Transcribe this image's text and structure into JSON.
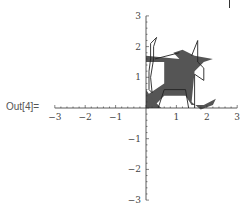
{
  "output_label": "Out[4]=",
  "chart_data": {
    "type": "polygon-graphics",
    "title": "",
    "xlabel": "",
    "ylabel": "",
    "xlim": [
      -3,
      3
    ],
    "ylim": [
      -3,
      3
    ],
    "grid": false,
    "axes_origin": [
      0,
      0
    ],
    "x_ticks": [
      -3,
      -2,
      -1,
      1,
      2,
      3
    ],
    "y_ticks": [
      -3,
      -2,
      -1,
      1,
      2,
      3
    ],
    "x_tick_labels": [
      "−3",
      "−2",
      "−1",
      "1",
      "2",
      "3"
    ],
    "y_tick_labels": [
      "−3",
      "−2",
      "−1",
      "1",
      "2",
      "3"
    ],
    "fill_color": "#555555",
    "line_color": "#222222",
    "filled_polygons": [
      {
        "name": "body",
        "points": [
          [
            0.0,
            1.5
          ],
          [
            0.6,
            1.5
          ],
          [
            0.6,
            0.8
          ],
          [
            0.0,
            0.4
          ],
          [
            0.0,
            0.0
          ],
          [
            0.3,
            0.1
          ],
          [
            0.6,
            0.4
          ],
          [
            1.3,
            0.4
          ],
          [
            1.5,
            0.1
          ],
          [
            1.9,
            0.1
          ],
          [
            2.3,
            0.3
          ],
          [
            2.2,
            0.1
          ],
          [
            1.8,
            -0.05
          ],
          [
            1.5,
            0.2
          ],
          [
            1.6,
            1.2
          ],
          [
            1.9,
            1.5
          ],
          [
            2.2,
            1.6
          ],
          [
            1.6,
            1.7
          ],
          [
            1.2,
            1.9
          ],
          [
            0.9,
            1.8
          ],
          [
            1.1,
            1.6
          ],
          [
            0.0,
            1.7
          ]
        ]
      },
      {
        "name": "left-leg",
        "points": [
          [
            0.0,
            0.0
          ],
          [
            0.0,
            0.6
          ],
          [
            0.2,
            0.3
          ],
          [
            0.5,
            0.0
          ]
        ]
      }
    ],
    "outline_polygons": [
      {
        "name": "left-curve",
        "points": [
          [
            0.15,
            1.6
          ],
          [
            0.15,
            2.1
          ],
          [
            0.35,
            2.3
          ],
          [
            0.25,
            2.0
          ],
          [
            0.25,
            1.6
          ],
          [
            0.15,
            1.0
          ],
          [
            0.2,
            0.5
          ],
          [
            0.1,
            0.6
          ],
          [
            0.1,
            1.2
          ],
          [
            0.15,
            1.6
          ]
        ]
      },
      {
        "name": "leg-box",
        "points": [
          [
            0.4,
            0.0
          ],
          [
            0.6,
            0.6
          ],
          [
            1.3,
            0.6
          ],
          [
            1.4,
            0.0
          ]
        ]
      },
      {
        "name": "top-line",
        "points": [
          [
            0.3,
            1.6
          ],
          [
            1.1,
            1.8
          ]
        ]
      },
      {
        "name": "horn",
        "points": [
          [
            1.5,
            1.7
          ],
          [
            1.7,
            2.2
          ],
          [
            1.7,
            1.5
          ]
        ]
      },
      {
        "name": "right-zigzag",
        "points": [
          [
            1.6,
            1.1
          ],
          [
            1.9,
            0.9
          ],
          [
            1.9,
            1.3
          ],
          [
            1.7,
            1.5
          ]
        ]
      },
      {
        "name": "right-leg",
        "points": [
          [
            1.6,
            1.1
          ],
          [
            1.6,
            0.0
          ]
        ]
      }
    ]
  }
}
